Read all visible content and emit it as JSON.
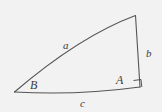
{
  "figure": {
    "type": "right-triangle-diagram",
    "background_color": "#f2f2f2",
    "stroke_color": "#555555",
    "label_color": "#3b3b3b",
    "sides": [
      {
        "id": "a",
        "label": "a",
        "role": "hypotenuse"
      },
      {
        "id": "b",
        "label": "b",
        "role": "vertical-leg"
      },
      {
        "id": "c",
        "label": "c",
        "role": "horizontal-leg"
      }
    ],
    "vertices": [
      {
        "id": "A",
        "label": "A",
        "position": "bottom-right",
        "angle": "right-angle"
      },
      {
        "id": "B",
        "label": "B",
        "position": "bottom-left",
        "angle": "acute"
      }
    ],
    "markers": [
      {
        "id": "right-angle-square",
        "at_vertex": "A"
      }
    ]
  }
}
